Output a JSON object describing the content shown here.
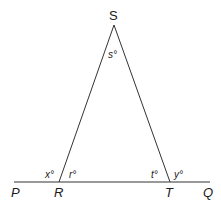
{
  "diagram": {
    "type": "geometry-triangle-exterior-angles",
    "stroke_color": "#333333",
    "vertices": {
      "S": {
        "label": "S",
        "x": 114,
        "y": 25
      },
      "R": {
        "label": "R",
        "x": 59,
        "y": 182
      },
      "T": {
        "label": "T",
        "x": 170,
        "y": 182
      }
    },
    "line_endpoints": {
      "P": {
        "label": "P",
        "x": 14,
        "y": 182
      },
      "Q": {
        "label": "Q",
        "x": 210,
        "y": 182
      }
    },
    "angles": {
      "s": "s°",
      "r": "r°",
      "t": "t°",
      "x": "x°",
      "y": "y°"
    }
  }
}
